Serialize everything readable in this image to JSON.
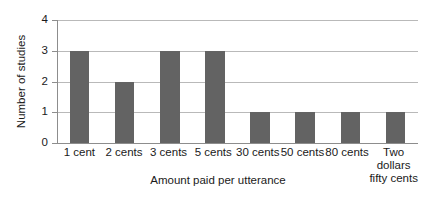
{
  "chart_data": {
    "type": "bar",
    "title": "",
    "xlabel": "Amount paid per utterance",
    "ylabel": "Number of studies",
    "categories": [
      "1 cent",
      "2 cents",
      "3 cents",
      "5 cents",
      "30 cents",
      "50 cents",
      "80 cents",
      "Two dollars fifty cents"
    ],
    "category_lines": [
      [
        "1 cent"
      ],
      [
        "2 cents"
      ],
      [
        "3 cents"
      ],
      [
        "5 cents"
      ],
      [
        "30 cents"
      ],
      [
        "50 cents"
      ],
      [
        "80 cents"
      ],
      [
        "Two",
        "dollars",
        "fifty cents"
      ]
    ],
    "values": [
      3,
      2,
      3,
      3,
      1,
      1,
      1,
      1
    ],
    "ylim": [
      0,
      4
    ],
    "yticks": [
      0,
      1,
      2,
      3,
      4
    ],
    "ytick_labels": [
      "0",
      "1",
      "2",
      "3",
      "4"
    ],
    "grid": true,
    "legend": false,
    "bar_color": "#636363",
    "gridline_color": "#b9b9b9",
    "axis_color": "#8d8d8d",
    "text_color": "#1a1a1a"
  }
}
